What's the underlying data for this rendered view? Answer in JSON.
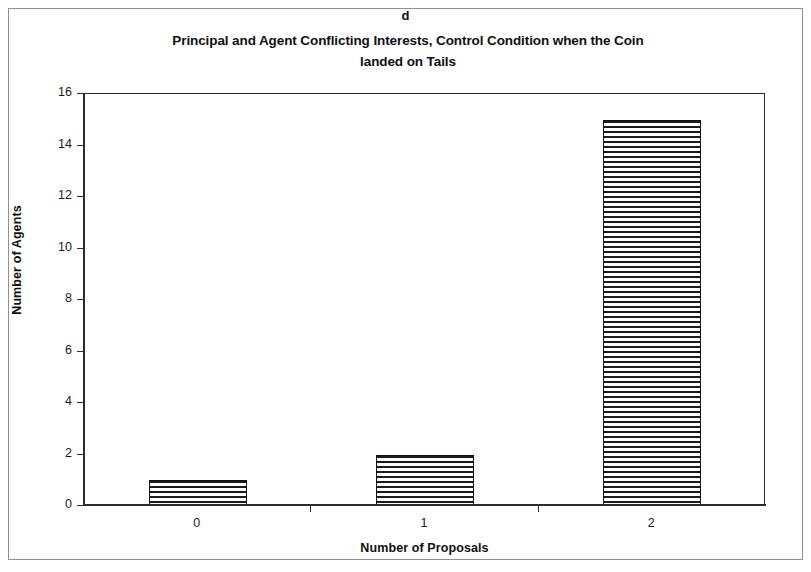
{
  "figure": {
    "panel_letter": "d",
    "title_line1": "Principal and Agent Conflicting Interests, Control Condition when the Coin",
    "title_line2": "landed on Tails"
  },
  "chart_data": {
    "type": "bar",
    "title": "Principal and Agent Conflicting Interests, Control Condition when the Coin landed on Tails",
    "panel_label": "d",
    "categories": [
      "0",
      "1",
      "2"
    ],
    "values": [
      1,
      2,
      15
    ],
    "xlabel": "Number of Proposals",
    "ylabel": "Number of Agents",
    "ylim": [
      0,
      16
    ],
    "ytick_step": 2,
    "yticks": [
      "0",
      "2",
      "4",
      "6",
      "8",
      "10",
      "12",
      "14",
      "16"
    ],
    "grid": false,
    "legend": null,
    "bar_fill": "horizontal-line-hatch",
    "bar_edge_color": "#111111",
    "plot_background": "#ffffff"
  },
  "style": {
    "frame_color": "#909090",
    "axis_color": "#2b2b2b",
    "text_color": "#101010"
  }
}
